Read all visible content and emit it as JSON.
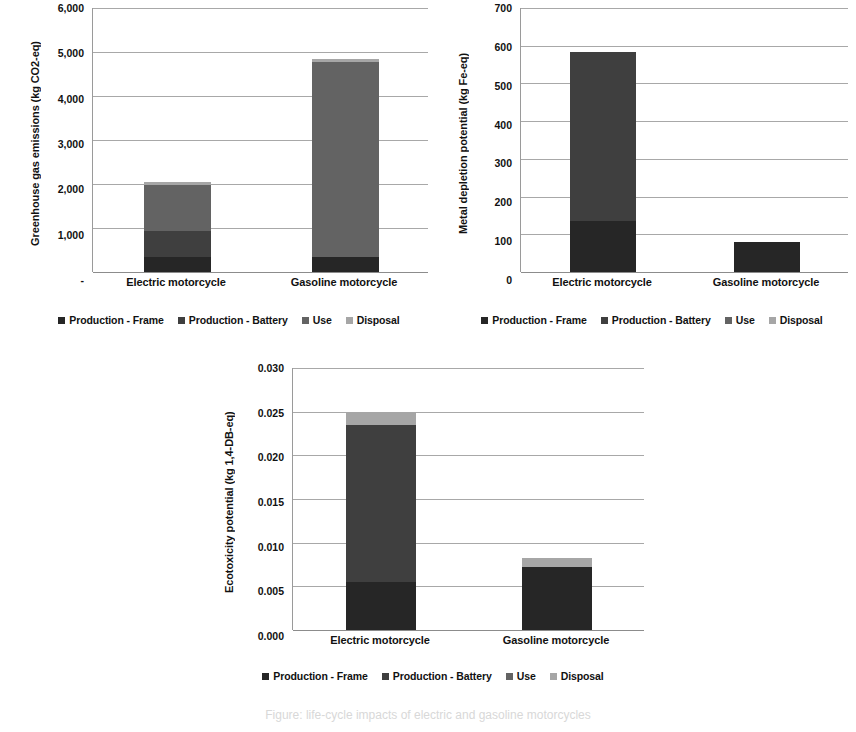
{
  "figure": {
    "footer_fragment": "Figure: life-cycle impacts of electric and gasoline motorcycles"
  },
  "legend": {
    "items": [
      {
        "label": "Production - Frame",
        "key": "frame",
        "color": "#262626"
      },
      {
        "label": "Production - Battery",
        "key": "battery",
        "color": "#3f3f3f"
      },
      {
        "label": "Use",
        "key": "use",
        "color": "#636363"
      },
      {
        "label": "Disposal",
        "key": "disposal",
        "color": "#a6a6a6"
      }
    ]
  },
  "chart_data": [
    {
      "id": "ghg",
      "type": "bar",
      "stacked": true,
      "title": "",
      "xlabel": "",
      "ylabel": "Greenhouse gas emissions (kg CO2-eq)",
      "categories": [
        "Electric motorcycle",
        "Gasoline motorcycle"
      ],
      "ylim": [
        0,
        6000
      ],
      "ytick_step": 1000,
      "ytick_labels": [
        "-",
        "1,000",
        "2,000",
        "3,000",
        "4,000",
        "5,000",
        "6,000"
      ],
      "ytick_values": [
        0,
        1000,
        2000,
        3000,
        4000,
        5000,
        6000
      ],
      "grid": true,
      "legend_position": "bottom",
      "series": [
        {
          "name": "Production - Frame",
          "values": [
            350,
            350
          ]
        },
        {
          "name": "Production - Battery",
          "values": [
            580,
            0
          ]
        },
        {
          "name": "Use",
          "values": [
            1050,
            4430
          ]
        },
        {
          "name": "Disposal",
          "values": [
            70,
            70
          ]
        }
      ],
      "totals": [
        2050,
        4850
      ]
    },
    {
      "id": "metal-depletion",
      "type": "bar",
      "stacked": true,
      "title": "",
      "xlabel": "",
      "ylabel": "Metal depletion potential (kg Fe-eq)",
      "categories": [
        "Electric motorcycle",
        "Gasoline motorcycle"
      ],
      "ylim": [
        0,
        700
      ],
      "ytick_step": 100,
      "ytick_labels": [
        "0",
        "100",
        "200",
        "300",
        "400",
        "500",
        "600",
        "700"
      ],
      "ytick_values": [
        0,
        100,
        200,
        300,
        400,
        500,
        600,
        700
      ],
      "grid": true,
      "legend_position": "bottom",
      "series": [
        {
          "name": "Production - Frame",
          "values": [
            135,
            80
          ]
        },
        {
          "name": "Production - Battery",
          "values": [
            448,
            0
          ]
        },
        {
          "name": "Use",
          "values": [
            0,
            0
          ]
        },
        {
          "name": "Disposal",
          "values": [
            0,
            0
          ]
        }
      ],
      "totals": [
        583,
        80
      ]
    },
    {
      "id": "ecotoxicity",
      "type": "bar",
      "stacked": true,
      "title": "",
      "xlabel": "",
      "ylabel": "Ecotoxicity potential (kg 1,4-DB-eq)",
      "categories": [
        "Electric motorcycle",
        "Gasoline motorcycle"
      ],
      "ylim": [
        0,
        0.03
      ],
      "ytick_step": 0.005,
      "ytick_labels": [
        "0.000",
        "0.005",
        "0.010",
        "0.015",
        "0.020",
        "0.025",
        "0.030"
      ],
      "ytick_values": [
        0,
        0.005,
        0.01,
        0.015,
        0.02,
        0.025,
        0.03
      ],
      "grid": true,
      "legend_position": "bottom",
      "series": [
        {
          "name": "Production - Frame",
          "values": [
            0.0055,
            0.0072
          ]
        },
        {
          "name": "Production - Battery",
          "values": [
            0.018,
            0
          ]
        },
        {
          "name": "Use",
          "values": [
            0,
            0
          ]
        },
        {
          "name": "Disposal",
          "values": [
            0.0015,
            0.0011
          ]
        }
      ],
      "totals": [
        0.025,
        0.0083
      ]
    }
  ]
}
